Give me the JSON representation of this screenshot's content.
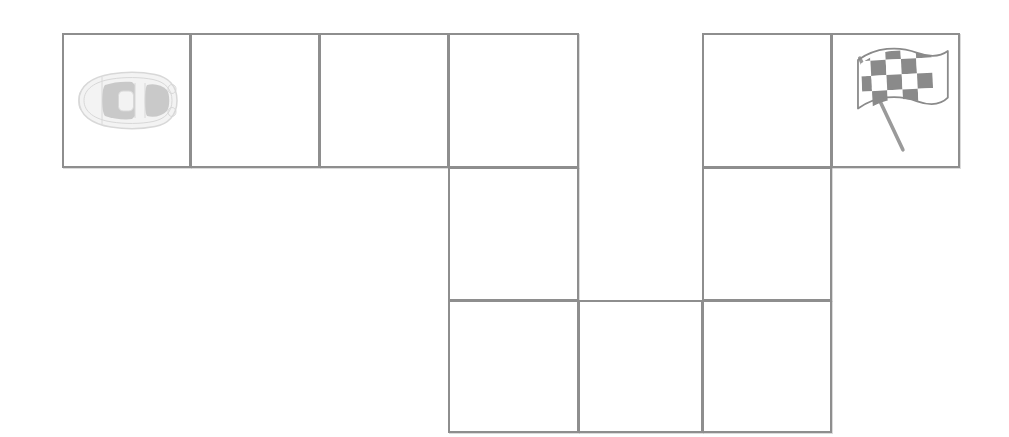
{
  "scene": {
    "name": "car-maze-path-grid",
    "background_color": "#ffffff",
    "width": 1009,
    "height": 437
  },
  "grid": {
    "line_color": "#8e8e8e",
    "line_width": 2,
    "cell_width": 129,
    "cell_height": 132,
    "origin_x": 62,
    "origin_y": 33,
    "columns_x": [
      62,
      190,
      319,
      448,
      578,
      702,
      831,
      959
    ],
    "rows_y": [
      33,
      168,
      300,
      432
    ]
  },
  "cells": [
    {
      "id": "r1c1",
      "name": "cell-row1-col1",
      "row": 1,
      "col": 1,
      "x": 62,
      "y": 33,
      "w": 129,
      "h": 135,
      "content": "car"
    },
    {
      "id": "r1c2",
      "name": "cell-row1-col2",
      "row": 1,
      "col": 2,
      "x": 190,
      "y": 33,
      "w": 130,
      "h": 135,
      "content": ""
    },
    {
      "id": "r1c3",
      "name": "cell-row1-col3",
      "row": 1,
      "col": 3,
      "x": 319,
      "y": 33,
      "w": 130,
      "h": 135,
      "content": ""
    },
    {
      "id": "r1c4",
      "name": "cell-row1-col4",
      "row": 1,
      "col": 4,
      "x": 448,
      "y": 33,
      "w": 131,
      "h": 135,
      "content": ""
    },
    {
      "id": "r1c6",
      "name": "cell-row1-col6",
      "row": 1,
      "col": 6,
      "x": 702,
      "y": 33,
      "w": 130,
      "h": 135,
      "content": ""
    },
    {
      "id": "r1c7",
      "name": "cell-row1-col7",
      "row": 1,
      "col": 7,
      "x": 831,
      "y": 33,
      "w": 129,
      "h": 135,
      "content": "flag"
    },
    {
      "id": "r2c4",
      "name": "cell-row2-col4",
      "row": 2,
      "col": 4,
      "x": 448,
      "y": 167,
      "w": 131,
      "h": 134,
      "content": ""
    },
    {
      "id": "r2c6",
      "name": "cell-row2-col6",
      "row": 2,
      "col": 6,
      "x": 702,
      "y": 167,
      "w": 130,
      "h": 134,
      "content": ""
    },
    {
      "id": "r3c4",
      "name": "cell-row3-col4",
      "row": 3,
      "col": 4,
      "x": 448,
      "y": 300,
      "w": 131,
      "h": 133,
      "content": ""
    },
    {
      "id": "r3c5",
      "name": "cell-row3-col5",
      "row": 3,
      "col": 5,
      "x": 578,
      "y": 300,
      "w": 125,
      "h": 133,
      "content": ""
    },
    {
      "id": "r3c6",
      "name": "cell-row3-col6",
      "row": 3,
      "col": 6,
      "x": 702,
      "y": 300,
      "w": 130,
      "h": 133,
      "content": ""
    }
  ],
  "pieces": {
    "car": {
      "icon": "car-top-view-icon",
      "label": "car",
      "x": 72,
      "y": 63,
      "width": 112,
      "height": 75,
      "body_color": "#f3f3f3",
      "outline_color": "#d8d8d8",
      "window_color": "#c9c9c9"
    },
    "flag": {
      "icon": "checkered-flag-icon",
      "label": "finish flag",
      "x": 852,
      "y": 42,
      "width": 100,
      "height": 115,
      "dark_color": "#8a8a8a",
      "light_color": "#ffffff",
      "pole_color": "#9a9a9a"
    }
  }
}
